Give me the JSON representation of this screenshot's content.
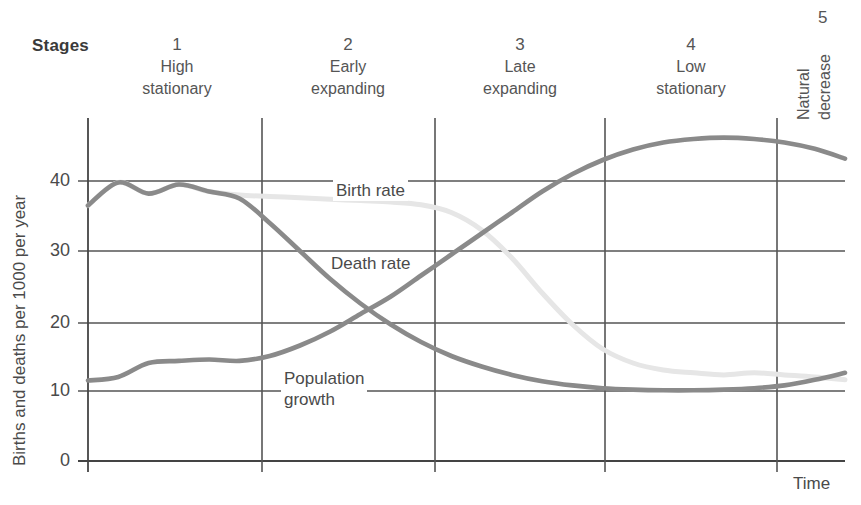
{
  "header": {
    "stages_label": "Stages"
  },
  "stages": [
    {
      "number": "1",
      "name_line1": "High",
      "name_line2": "stationary",
      "center_x": 177
    },
    {
      "number": "2",
      "name_line1": "Early",
      "name_line2": "expanding",
      "center_x": 348
    },
    {
      "number": "3",
      "name_line1": "Late",
      "name_line2": "expanding",
      "center_x": 520
    },
    {
      "number": "4",
      "name_line1": "Low",
      "name_line2": "stationary",
      "center_x": 691
    },
    {
      "number": "5",
      "name_line1": "Natural",
      "name_line2": "decrease",
      "center_x": 812
    }
  ],
  "axes": {
    "y_title": "Births and deaths per 1000 per year",
    "x_title": "Time",
    "y_ticks": [
      "0",
      "10",
      "20",
      "30",
      "40"
    ],
    "y_min": 0,
    "y_max": 50
  },
  "series_labels": {
    "birth_rate": "Birth rate",
    "death_rate": "Death rate",
    "population_growth_line1": "Population",
    "population_growth_line2": "growth"
  },
  "colors": {
    "birth_rate": "#e6e6e6",
    "death_rate": "#8a8a8a",
    "population_growth": "#8a8a8a",
    "grid": "#555555",
    "axis": "#444444",
    "text": "#4a4a4a"
  },
  "chart_data": {
    "type": "line",
    "xlabel": "Time",
    "ylabel": "Births and deaths per 1000 per year",
    "ylim": [
      0,
      50
    ],
    "yticks": [
      0,
      10,
      20,
      30,
      40
    ],
    "grid": true,
    "legend": "inline-labels",
    "stage_boundaries_x": [
      0,
      1,
      2,
      3,
      4,
      4.7,
      5
    ],
    "x": [
      0,
      0.2,
      0.4,
      0.6,
      0.8,
      1.0,
      1.2,
      1.4,
      1.6,
      1.8,
      2.0,
      2.2,
      2.4,
      2.6,
      2.8,
      3.0,
      3.2,
      3.4,
      3.6,
      3.8,
      4.0,
      4.2,
      4.4,
      4.6,
      4.8,
      5.0
    ],
    "series": [
      {
        "name": "Birth rate",
        "color": "#e6e6e6",
        "values": [
          36.5,
          39.8,
          38.2,
          39.5,
          38.5,
          38.0,
          37.8,
          37.6,
          37.4,
          37.2,
          37.0,
          36.6,
          35.5,
          33.0,
          29.0,
          24.0,
          19.5,
          16.0,
          14.0,
          13.0,
          12.6,
          12.3,
          12.6,
          12.3,
          12.0,
          11.6
        ]
      },
      {
        "name": "Death rate",
        "color": "#8a8a8a",
        "values": [
          36.5,
          39.8,
          38.2,
          39.5,
          38.5,
          37.5,
          34.0,
          30.0,
          26.0,
          22.5,
          19.5,
          17.0,
          15.0,
          13.5,
          12.3,
          11.4,
          10.8,
          10.4,
          10.2,
          10.1,
          10.1,
          10.2,
          10.4,
          10.8,
          11.6,
          12.6
        ]
      },
      {
        "name": "Population growth",
        "color": "#8a8a8a",
        "values": [
          11.5,
          12.0,
          14.0,
          14.3,
          14.5,
          14.3,
          15.0,
          16.5,
          18.5,
          21.0,
          23.5,
          26.5,
          29.5,
          32.5,
          35.5,
          38.5,
          41.0,
          43.0,
          44.5,
          45.5,
          46.0,
          46.2,
          46.0,
          45.5,
          44.6,
          43.2
        ]
      }
    ],
    "annotations": [
      {
        "text": "Birth rate",
        "x_px": 335,
        "y_px": 190
      },
      {
        "text": "Death rate",
        "x_px": 330,
        "y_px": 263
      },
      {
        "text": "Population growth",
        "x_px": 283,
        "y_px": 378
      }
    ]
  }
}
